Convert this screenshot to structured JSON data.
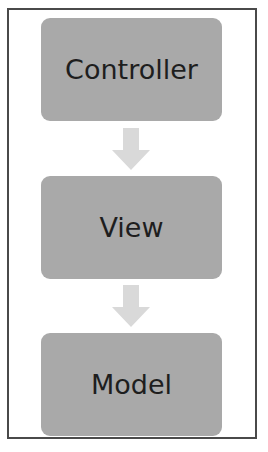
{
  "diagram": {
    "type": "vertical-flow",
    "nodes": [
      {
        "id": "controller",
        "label": "Controller"
      },
      {
        "id": "view",
        "label": "View"
      },
      {
        "id": "model",
        "label": "Model"
      }
    ],
    "edges": [
      {
        "from": "controller",
        "to": "view",
        "icon": "arrow-down-icon"
      },
      {
        "from": "view",
        "to": "model",
        "icon": "arrow-down-icon"
      }
    ],
    "colors": {
      "node_fill": "#a9a9a9",
      "arrow_fill": "#d9d9d9",
      "border": "#4a4a4a",
      "text": "#1e1e1e"
    }
  }
}
